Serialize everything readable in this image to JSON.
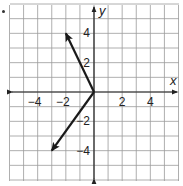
{
  "figure": {
    "type": "coordinate-plane-vectors",
    "problem_marker": "."
  },
  "axes": {
    "x_label": "x",
    "y_label": "y",
    "x_range": [
      -6,
      6
    ],
    "y_range": [
      -6,
      6
    ],
    "grid_step": 1,
    "x_tick_labels": [
      {
        "value": -4,
        "label": "−4"
      },
      {
        "value": -2,
        "label": "−2"
      },
      {
        "value": 2,
        "label": "2"
      },
      {
        "value": 4,
        "label": "4"
      }
    ],
    "y_tick_labels": [
      {
        "value": 4,
        "label": "4"
      },
      {
        "value": 2,
        "label": "2"
      },
      {
        "value": -2,
        "label": "−2"
      },
      {
        "value": -4,
        "label": "−4"
      }
    ]
  },
  "vectors": [
    {
      "name": "vector-upper-left",
      "from": [
        0,
        0
      ],
      "to": [
        -2,
        4
      ]
    },
    {
      "name": "vector-lower-left",
      "from": [
        0,
        0
      ],
      "to": [
        -3,
        -4
      ]
    }
  ],
  "colors": {
    "grid": "#9a9a9a",
    "axis": "#222222",
    "vector": "#1a1a1a",
    "text": "#222222",
    "background": "#ffffff"
  }
}
